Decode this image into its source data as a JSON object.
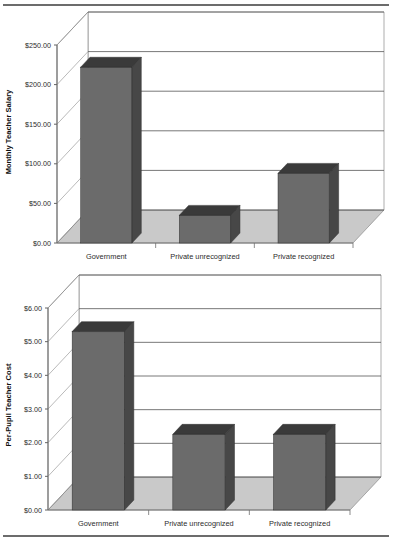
{
  "page": {
    "background_color": "#ffffff",
    "frame_rule_color": "#3b3b3b"
  },
  "style": {
    "bar_front_color": "#6b6b6b",
    "bar_side_color": "#474747",
    "bar_top_color": "#3a3a3a",
    "floor_color": "#c9c9c9",
    "wall_color": "#ffffff",
    "gridline_color": "#555555",
    "frame_color": "#8a8a8a"
  },
  "charts": [
    {
      "id": "chart-salary",
      "ylabel": "Monthly Teacher Salary",
      "ticks": [
        "$0.00",
        "$50.00",
        "$100.00",
        "$150.00",
        "$200.00",
        "$250.00"
      ],
      "categories": [
        "Government",
        "Private unrecognized",
        "Private recognized"
      ],
      "values": [
        222,
        35,
        88
      ]
    },
    {
      "id": "chart-cost",
      "ylabel": "Per-Pupil Teacher Cost",
      "ticks": [
        "$0.00",
        "$1.00",
        "$2.00",
        "$3.00",
        "$4.00",
        "$5.00",
        "$6.00"
      ],
      "categories": [
        "Government",
        "Private unrecognized",
        "Private recognized"
      ],
      "values": [
        5.3,
        2.25,
        2.25
      ]
    }
  ],
  "chart_data": [
    {
      "type": "bar",
      "title": "",
      "xlabel": "",
      "ylabel": "Monthly Teacher Salary",
      "categories": [
        "Government",
        "Private unrecognized",
        "Private recognized"
      ],
      "values": [
        222,
        35,
        88
      ],
      "ytick_labels": [
        "$0.00",
        "$50.00",
        "$100.00",
        "$150.00",
        "$200.00",
        "$250.00"
      ],
      "ytick_values": [
        0,
        50,
        100,
        150,
        200,
        250
      ],
      "ylim": [
        0,
        250
      ],
      "grid": true,
      "legend": "none",
      "projection": "3d"
    },
    {
      "type": "bar",
      "title": "",
      "xlabel": "",
      "ylabel": "Per-Pupil Teacher Cost",
      "categories": [
        "Government",
        "Private unrecognized",
        "Private recognized"
      ],
      "values": [
        5.3,
        2.25,
        2.25
      ],
      "ytick_labels": [
        "$0.00",
        "$1.00",
        "$2.00",
        "$3.00",
        "$4.00",
        "$5.00",
        "$6.00"
      ],
      "ytick_values": [
        0,
        1,
        2,
        3,
        4,
        5,
        6
      ],
      "ylim": [
        0,
        6
      ],
      "grid": true,
      "legend": "none",
      "projection": "3d"
    }
  ]
}
